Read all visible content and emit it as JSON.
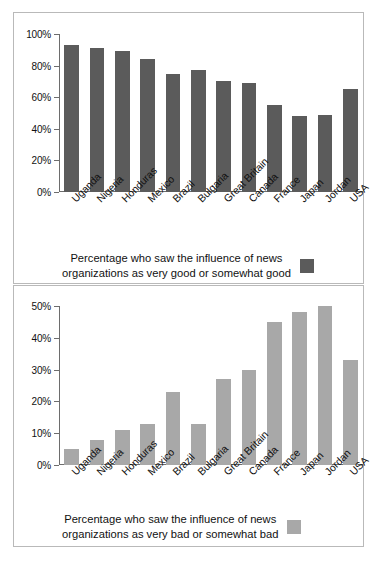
{
  "chart_data": [
    {
      "type": "bar",
      "id": "good-influence",
      "title": "",
      "xlabel": "",
      "ylabel": "",
      "ylim": [
        0,
        100
      ],
      "ytick_labels": [
        "100%",
        "80%",
        "60%",
        "40%",
        "20%",
        "0%"
      ],
      "ytick_values": [
        100,
        80,
        60,
        40,
        20,
        0
      ],
      "grid": false,
      "bar_color": "#5b5b5b",
      "legend_position": "below",
      "legend": "Percentage who saw the influence of news\norganizations as very good or somewhat good",
      "categories": [
        "Uganda",
        "Nigeria",
        "Honduras",
        "Mexico",
        "Brazil",
        "Bulgaria",
        "Great Britain",
        "Canada",
        "France",
        "Japan",
        "Jordan",
        "USA"
      ],
      "values": [
        93,
        91,
        89,
        84,
        75,
        77,
        70,
        69,
        55,
        48,
        49,
        65
      ]
    },
    {
      "type": "bar",
      "id": "bad-influence",
      "title": "",
      "xlabel": "",
      "ylabel": "",
      "ylim": [
        0,
        50
      ],
      "ytick_labels": [
        "50%",
        "40%",
        "30%",
        "20%",
        "10%",
        "0%"
      ],
      "ytick_values": [
        50,
        40,
        30,
        20,
        10,
        0
      ],
      "grid": false,
      "bar_color": "#a8a8a8",
      "legend_position": "below",
      "legend": "Percentage who saw the influence of news\norganizations as very bad or somewhat bad",
      "categories": [
        "Uganda",
        "Nigeria",
        "Honduras",
        "Mexico",
        "Brazil",
        "Bulgaria",
        "Great Britain",
        "Canada",
        "France",
        "Japan",
        "Jordan",
        "USA"
      ],
      "values": [
        5,
        8,
        11,
        13,
        23,
        13,
        27,
        30,
        45,
        48,
        50,
        33
      ]
    }
  ]
}
